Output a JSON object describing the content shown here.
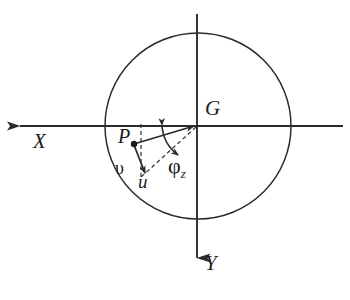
{
  "figure": {
    "kind": "coordinate-diagram",
    "background_color": "#ffffff",
    "stroke_color": "#2b2b2b",
    "labels": {
      "x_axis": "X",
      "y_axis": "Y",
      "centroid": "G",
      "point": "P",
      "displacement_u": "u",
      "displacement_v": "υ",
      "rotation_symbol": "φ",
      "rotation_subscript": "z"
    },
    "geometry": {
      "circle_center_x": 198,
      "circle_center_y": 126,
      "circle_radius": 93,
      "x_axis_y": 126,
      "x_axis_left_end": 12,
      "x_axis_right_end": 343,
      "y_axis_x": 197,
      "y_axis_top_end": 14,
      "y_axis_bottom_end": 270,
      "point_p_x": 134,
      "point_p_y": 144,
      "dashed_vertical_x": 141,
      "u_arrow_tip_x": 144,
      "u_arrow_tip_y": 172,
      "arc_start_angle_deg": 150,
      "arc_end_angle_deg": 208
    }
  }
}
